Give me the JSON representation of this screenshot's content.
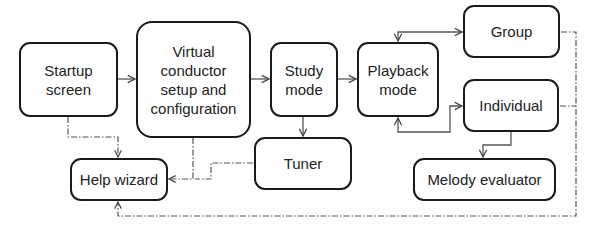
{
  "diagram": {
    "nodes": [
      {
        "id": "startup",
        "label": "Startup\nscreen",
        "x": 19,
        "y": 42,
        "w": 99,
        "h": 75
      },
      {
        "id": "vc",
        "label": "Virtual\nconductor\nsetup and\nconfiguration",
        "x": 136,
        "y": 21,
        "w": 115,
        "h": 117
      },
      {
        "id": "study",
        "label": "Study\nmode",
        "x": 270,
        "y": 42,
        "w": 68,
        "h": 75
      },
      {
        "id": "tuner",
        "label": "Tuner",
        "x": 254,
        "y": 137,
        "w": 98,
        "h": 53
      },
      {
        "id": "playback",
        "label": "Playback\nmode",
        "x": 357,
        "y": 42,
        "w": 82,
        "h": 75
      },
      {
        "id": "group",
        "label": "Group",
        "x": 463,
        "y": 5,
        "w": 97,
        "h": 53
      },
      {
        "id": "individual",
        "label": "Individual",
        "x": 463,
        "y": 79,
        "w": 96,
        "h": 53
      },
      {
        "id": "melody",
        "label": "Melody evaluator",
        "x": 413,
        "y": 158,
        "w": 143,
        "h": 43
      },
      {
        "id": "help",
        "label": "Help wizard",
        "x": 70,
        "y": 158,
        "w": 98,
        "h": 43
      }
    ],
    "edges": [
      {
        "from": "startup",
        "to": "vc",
        "style": "solid"
      },
      {
        "from": "vc",
        "to": "study",
        "style": "solid"
      },
      {
        "from": "study",
        "to": "playback",
        "style": "solid"
      },
      {
        "from": "study",
        "to": "tuner",
        "style": "solid"
      },
      {
        "from": "playback",
        "to": "group",
        "style": "solid",
        "bidirectional": true
      },
      {
        "from": "playback",
        "to": "individual",
        "style": "solid",
        "bidirectional": true
      },
      {
        "from": "individual",
        "to": "melody",
        "style": "solid"
      },
      {
        "from": "startup",
        "to": "help",
        "style": "dash-dot"
      },
      {
        "from": "vc",
        "to": "help",
        "style": "dash-dot"
      },
      {
        "from": "tuner",
        "to": "help",
        "style": "dash-dot"
      },
      {
        "from": "group",
        "to": "help",
        "style": "dash-dot"
      },
      {
        "from": "individual",
        "to": "help",
        "style": "dash-dot"
      }
    ]
  }
}
